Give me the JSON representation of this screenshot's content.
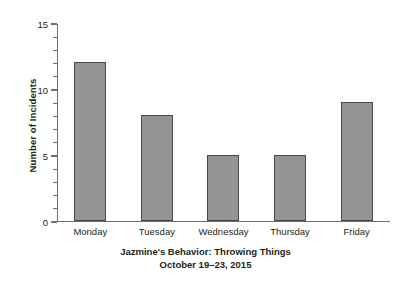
{
  "chart_data": {
    "type": "bar",
    "title": "Jazmine's Behavior: Throwing Things",
    "subtitle": "October 19–23, 2015",
    "xlabel": "",
    "ylabel": "Number of Incidents",
    "categories": [
      "Monday",
      "Tuesday",
      "Wednesday",
      "Thursday",
      "Friday"
    ],
    "values": [
      12,
      8,
      5,
      5,
      9
    ],
    "ylim": [
      0,
      15
    ],
    "y_major_ticks": [
      0,
      5,
      10,
      15
    ],
    "y_tick_labels": [
      "0",
      "5",
      "10",
      "15"
    ],
    "y_minor_tick_interval": 1,
    "grid": false,
    "legend": null,
    "bar_fill_color": "#949494",
    "bar_edge_color": "#4a4a4a",
    "axis_color": "#6e6e6e",
    "text_color": "#231f20",
    "background_color": "#ffffff"
  }
}
